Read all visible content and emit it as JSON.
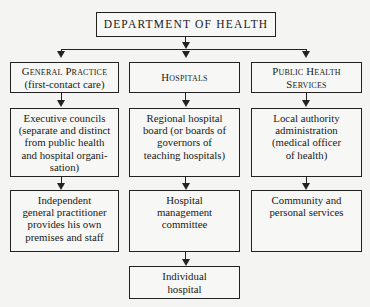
{
  "chart": {
    "title": "DEPARTMENT OF HEALTH",
    "columns": [
      {
        "header": {
          "line1": "General Practice",
          "line2": "(first-contact care)"
        },
        "level2": [
          "Executive councils",
          "(separate and distinct",
          "from public health",
          "and hospital organi-",
          "sation)"
        ],
        "level3": [
          "Independent",
          "general practitioner",
          "provides his own",
          "premises and staff"
        ]
      },
      {
        "header": {
          "line1": "Hospitals",
          "line2": ""
        },
        "level2": [
          "Regional hospital",
          "board (or boards of",
          "governors of",
          "teaching hospitals)"
        ],
        "level3": [
          "Hospital",
          "management",
          "committee"
        ],
        "level4": [
          "Individual",
          "hospital"
        ]
      },
      {
        "header": {
          "line1": "Public Health",
          "line2": "Services"
        },
        "level2": [
          "Local authority",
          "administration",
          "(medical officer",
          "of health)"
        ],
        "level3": [
          "Community and",
          "personal services"
        ]
      }
    ]
  },
  "colors": {
    "line": "#222222",
    "background": "#f4f4f2"
  }
}
